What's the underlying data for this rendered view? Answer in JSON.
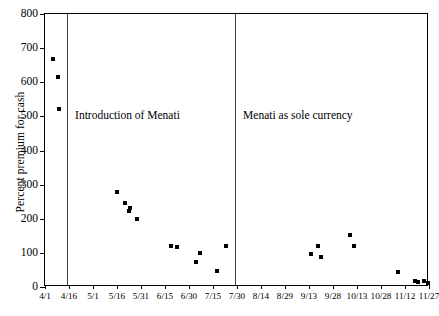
{
  "chart_data": {
    "type": "scatter",
    "title": "",
    "xlabel": "",
    "ylabel": "Percent premium for cash",
    "ylim": [
      0,
      800
    ],
    "ytick_step": 100,
    "yticks": [
      0,
      100,
      200,
      300,
      400,
      500,
      600,
      700,
      800
    ],
    "xticks": [
      "4/1",
      "4/16",
      "5/1",
      "5/16",
      "5/31",
      "6/15",
      "6/30",
      "7/15",
      "7/30",
      "8/14",
      "8/29",
      "9/13",
      "9/28",
      "10/13",
      "10/28",
      "11/12",
      "11/27"
    ],
    "grid": false,
    "legend": false,
    "marker": "square",
    "marker_color": "#000000",
    "series": [
      {
        "name": "Percent premium for cash",
        "points": [
          {
            "x": "4/1",
            "xf": 0.02,
            "y": 667
          },
          {
            "x": "4/3",
            "xf": 0.034,
            "y": 615
          },
          {
            "x": "4/6",
            "xf": 0.037,
            "y": 523
          },
          {
            "x": "4/19",
            "xf": 0.188,
            "y": 278
          },
          {
            "x": "4/22",
            "xf": 0.208,
            "y": 245
          },
          {
            "x": "4/24",
            "xf": 0.222,
            "y": 232
          },
          {
            "x": "4/24",
            "xf": 0.218,
            "y": 222
          },
          {
            "x": "4/28",
            "xf": 0.24,
            "y": 200
          },
          {
            "x": "5/17",
            "xf": 0.327,
            "y": 120
          },
          {
            "x": "5/20",
            "xf": 0.343,
            "y": 118
          },
          {
            "x": "6/2",
            "xf": 0.403,
            "y": 100
          },
          {
            "x": "6/5",
            "xf": 0.392,
            "y": 72
          },
          {
            "x": "6/13",
            "xf": 0.448,
            "y": 46
          },
          {
            "x": "6/18",
            "xf": 0.472,
            "y": 120
          },
          {
            "x": "8/26",
            "xf": 0.693,
            "y": 97
          },
          {
            "x": "8/30",
            "xf": 0.71,
            "y": 120
          },
          {
            "x": "9/1",
            "xf": 0.719,
            "y": 88
          },
          {
            "x": "9/17",
            "xf": 0.793,
            "y": 153
          },
          {
            "x": "9/22",
            "xf": 0.805,
            "y": 120
          },
          {
            "x": "10/28",
            "xf": 0.92,
            "y": 45
          },
          {
            "x": "11/12",
            "xf": 0.963,
            "y": 17
          },
          {
            "x": "11/14",
            "xf": 0.972,
            "y": 16
          },
          {
            "x": "11/22",
            "xf": 0.988,
            "y": 18
          },
          {
            "x": "11/27",
            "xf": 0.997,
            "y": 13
          }
        ]
      }
    ],
    "event_markers": [
      {
        "id": "introduction",
        "label": "Introduction of Menati",
        "xf": 0.0575
      },
      {
        "id": "sole-currency",
        "label": "Menati as sole currency",
        "xf": 0.495
      }
    ]
  }
}
